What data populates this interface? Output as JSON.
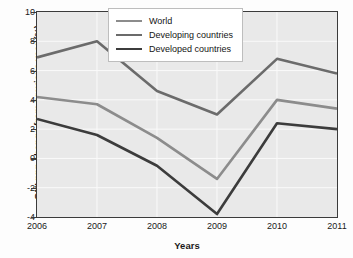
{
  "chart_data": {
    "type": "line",
    "title": "",
    "xlabel": "Years",
    "ylabel": "GNI ppp change from previous year (%)",
    "categories": [
      "2006",
      "2007",
      "2008",
      "2009",
      "2010",
      "2011"
    ],
    "x": [
      2006,
      2007,
      2008,
      2009,
      2010,
      2011
    ],
    "xlim": [
      2006,
      2011
    ],
    "ylim": [
      -4,
      10
    ],
    "yticks": [
      -4,
      -2,
      0,
      2,
      4,
      6,
      8,
      10
    ],
    "ytick_labels": [
      "-4",
      "-2",
      "0",
      "2",
      "4",
      "6",
      "8",
      "10"
    ],
    "xtick_labels": [
      "2006",
      "2007",
      "2008",
      "2009",
      "2010",
      "2011"
    ],
    "grid": true,
    "legend_position": "top-center",
    "series": [
      {
        "name": "World",
        "color": "#8c8c8c",
        "values": [
          4.2,
          3.7,
          1.4,
          -1.4,
          4.0,
          3.4
        ]
      },
      {
        "name": "Developing countries",
        "color": "#6b6b6b",
        "values": [
          6.9,
          8.0,
          4.6,
          3.0,
          6.8,
          5.8
        ]
      },
      {
        "name": "Developed countries",
        "color": "#3c3c3c",
        "values": [
          2.7,
          1.6,
          -0.5,
          -3.8,
          2.4,
          2.0
        ]
      }
    ]
  },
  "colors": {
    "plot_background": "#e9e9e9",
    "figure_background": "#fdfdfd",
    "axis": "#3b3b3b",
    "gridline": "#fafafa",
    "legend_background": "#ffffff",
    "legend_border": "#bdbdbd"
  }
}
